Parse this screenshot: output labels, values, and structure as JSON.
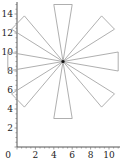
{
  "chart_data": {
    "type": "line",
    "title": "",
    "xlabel": "",
    "ylabel": "",
    "xlim": [
      0,
      11
    ],
    "ylim": [
      0,
      15
    ],
    "grid": false,
    "legend": null,
    "x_ticks": [
      "0",
      "2",
      "4",
      "6",
      "8",
      "10"
    ],
    "y_ticks": [
      "2",
      "4",
      "6",
      "8",
      "10",
      "12",
      "14"
    ],
    "center": [
      5,
      9
    ],
    "series": [
      {
        "name": "spoke-top",
        "points": [
          [
            5,
            9
          ],
          [
            4,
            15
          ],
          [
            6,
            15
          ],
          [
            5,
            9
          ]
        ]
      },
      {
        "name": "spoke-upper-right",
        "points": [
          [
            5,
            9
          ],
          [
            9.2,
            13.8
          ],
          [
            10.6,
            12.4
          ],
          [
            5,
            9
          ]
        ]
      },
      {
        "name": "spoke-right",
        "points": [
          [
            5,
            9
          ],
          [
            11,
            10
          ],
          [
            11,
            8
          ],
          [
            5,
            9
          ]
        ]
      },
      {
        "name": "spoke-lower-right",
        "points": [
          [
            5,
            9
          ],
          [
            10.6,
            5.6
          ],
          [
            9.2,
            4.2
          ],
          [
            5,
            9
          ]
        ]
      },
      {
        "name": "spoke-bottom",
        "points": [
          [
            5,
            9
          ],
          [
            6,
            3
          ],
          [
            4,
            3
          ],
          [
            5,
            9
          ]
        ]
      },
      {
        "name": "spoke-lower-left",
        "points": [
          [
            5,
            9
          ],
          [
            0.8,
            4.2
          ],
          [
            -0.6,
            5.6
          ],
          [
            5,
            9
          ]
        ]
      },
      {
        "name": "spoke-left",
        "points": [
          [
            5,
            9
          ],
          [
            -1,
            8
          ],
          [
            -1,
            10
          ],
          [
            5,
            9
          ]
        ]
      },
      {
        "name": "spoke-upper-left",
        "points": [
          [
            5,
            9
          ],
          [
            -0.6,
            12.4
          ],
          [
            0.8,
            13.8
          ],
          [
            5,
            9
          ]
        ]
      }
    ],
    "colors": {
      "spoke": "#9a9a9a",
      "axis": "#555555",
      "center": "#111111"
    }
  }
}
